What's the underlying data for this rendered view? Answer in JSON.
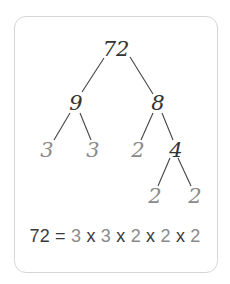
{
  "diagram": {
    "type": "factor-tree",
    "root": "72",
    "nodes": [
      {
        "id": "n72",
        "label": "72",
        "kind": "composite",
        "x": 116,
        "y": 56
      },
      {
        "id": "n9",
        "label": "9",
        "kind": "composite",
        "x": 76,
        "y": 110
      },
      {
        "id": "n8",
        "label": "8",
        "kind": "composite",
        "x": 158,
        "y": 110
      },
      {
        "id": "n3a",
        "label": "3",
        "kind": "prime",
        "x": 47,
        "y": 157
      },
      {
        "id": "n3b",
        "label": "3",
        "kind": "prime",
        "x": 93,
        "y": 157
      },
      {
        "id": "n2a",
        "label": "2",
        "kind": "prime",
        "x": 138,
        "y": 157
      },
      {
        "id": "n4",
        "label": "4",
        "kind": "composite",
        "x": 176,
        "y": 157
      },
      {
        "id": "n2b",
        "label": "2",
        "kind": "prime",
        "x": 155,
        "y": 203
      },
      {
        "id": "n2c",
        "label": "2",
        "kind": "prime",
        "x": 195,
        "y": 203
      }
    ],
    "edges": [
      {
        "from": "n72",
        "to": "n9",
        "x1": 104,
        "y1": 58,
        "x2": 82,
        "y2": 92
      },
      {
        "from": "n72",
        "to": "n8",
        "x1": 130,
        "y1": 57,
        "x2": 153,
        "y2": 94
      },
      {
        "from": "n9",
        "to": "n3a",
        "x1": 70,
        "y1": 113,
        "x2": 54,
        "y2": 140
      },
      {
        "from": "n9",
        "to": "n3b",
        "x1": 80,
        "y1": 113,
        "x2": 91,
        "y2": 140
      },
      {
        "from": "n8",
        "to": "n2a",
        "x1": 153,
        "y1": 113,
        "x2": 141,
        "y2": 140
      },
      {
        "from": "n8",
        "to": "n4",
        "x1": 162,
        "y1": 113,
        "x2": 173,
        "y2": 140
      },
      {
        "from": "n4",
        "to": "n2b",
        "x1": 170,
        "y1": 158,
        "x2": 158,
        "y2": 186
      },
      {
        "from": "n4",
        "to": "n2c",
        "x1": 178,
        "y1": 158,
        "x2": 191,
        "y2": 186
      }
    ],
    "equation": {
      "lhs": "72",
      "equals": "=",
      "factors": [
        "3",
        "3",
        "2",
        "2",
        "2"
      ],
      "operator": "x"
    },
    "colors": {
      "composite": "#333333",
      "prime": "#8a8a8a",
      "line": "#444444",
      "border": "#d6d6d6"
    }
  }
}
